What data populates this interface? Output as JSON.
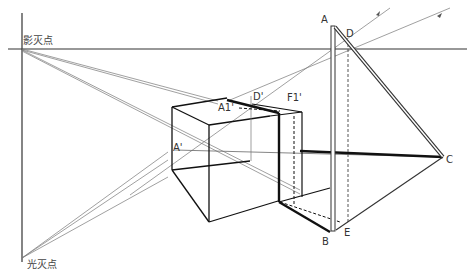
{
  "labels": {
    "shadow_vanishing_point": "影灭点",
    "light_vanishing_point": "光灭点",
    "A": "A",
    "B": "B",
    "C": "C",
    "D": "D",
    "E": "E",
    "A_prime": "A'",
    "A1_prime": "A1'",
    "D_prime": "D'",
    "F1_prime": "F1'"
  },
  "colors": {
    "background": "#ffffff",
    "thick_line": "#111111",
    "thin_line": "#666666",
    "text": "#333333"
  }
}
